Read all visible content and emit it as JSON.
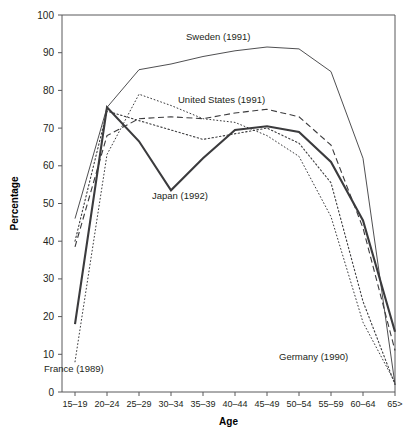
{
  "chart_data": {
    "type": "line",
    "title": "",
    "xlabel": "Age",
    "ylabel": "Percentage",
    "ylim": [
      0,
      100
    ],
    "ytick_step": 10,
    "grid": false,
    "legend_position": "inline-annotations",
    "categories": [
      "15–19",
      "20–24",
      "25–29",
      "30–34",
      "35–39",
      "40–44",
      "45–49",
      "50–54",
      "55–59",
      "60–64",
      "65>"
    ],
    "yticks": [
      "0",
      "10",
      "20",
      "30",
      "40",
      "50",
      "60",
      "70",
      "80",
      "90",
      "100"
    ],
    "series": [
      {
        "name": "Sweden (1991)",
        "label": "Sweden (1991)",
        "style": "solid-thin",
        "color": "#3b3b3d",
        "values": [
          46,
          75.5,
          85.5,
          87,
          89,
          90.5,
          91.5,
          91,
          85,
          62,
          2
        ]
      },
      {
        "name": "United States (1991)",
        "label": "United States (1991)",
        "style": "dashed",
        "color": "#3b3b3d",
        "values": [
          38.5,
          68,
          72.5,
          73,
          72.5,
          74,
          75,
          73,
          65.5,
          43.5,
          11
        ]
      },
      {
        "name": "Japan (1992)",
        "label": "Japan (1992)",
        "style": "solid-bold",
        "color": "#1a1a1a",
        "values": [
          18,
          75.5,
          66.5,
          53.5,
          62,
          69.5,
          70.5,
          69,
          61,
          45.5,
          16
        ]
      },
      {
        "name": "France (1989)",
        "label": "France (1989)",
        "style": "dotted-fine",
        "color": "#6e6e70",
        "values": [
          8,
          63,
          79,
          76,
          72.5,
          71.5,
          68,
          62.5,
          46.5,
          18.5,
          2.5
        ]
      },
      {
        "name": "Germany (1990)",
        "label": "Germany (1990)",
        "style": "dotted",
        "color": "#6e6e70",
        "values": [
          40,
          74.5,
          72,
          69.5,
          67,
          68.5,
          70,
          66,
          55.5,
          24,
          2
        ]
      }
    ],
    "annotations": [
      {
        "text": "Sweden (1991)",
        "x": 186,
        "y": 40,
        "name": "label-sweden"
      },
      {
        "text": "United States (1991)",
        "x": 178,
        "y": 103,
        "name": "label-united-states"
      },
      {
        "text": "Japan (1992)",
        "x": 152,
        "y": 199,
        "name": "label-japan"
      },
      {
        "text": "France (1989)",
        "x": 44,
        "y": 372,
        "name": "label-france"
      },
      {
        "text": "Germany (1990)",
        "x": 279,
        "y": 360,
        "name": "label-germany"
      }
    ]
  }
}
